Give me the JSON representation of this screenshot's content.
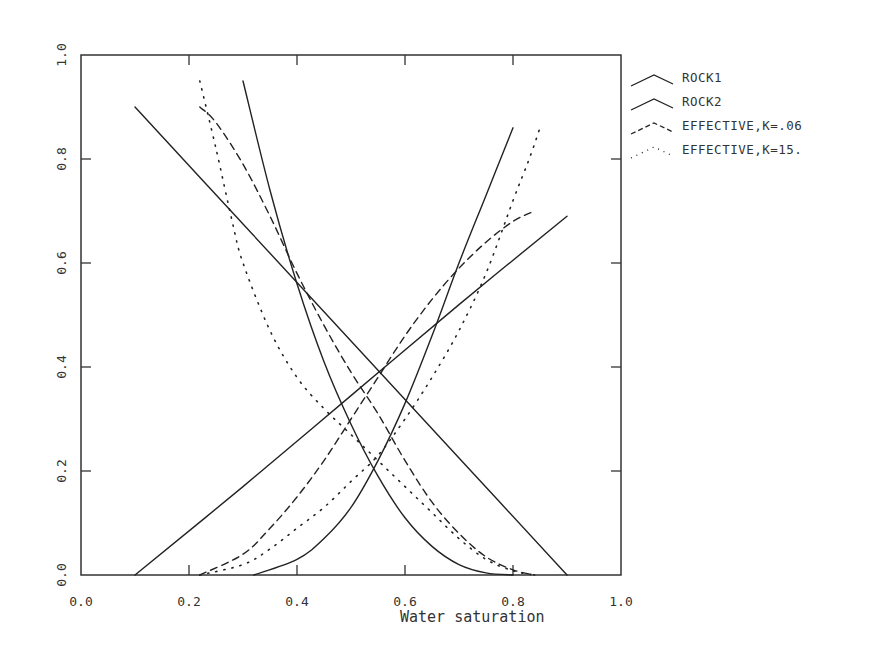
{
  "chart_data": {
    "type": "line",
    "title": "",
    "xlabel": "Water saturation",
    "ylabel": "",
    "xlim": [
      0.0,
      1.0
    ],
    "ylim": [
      0.0,
      1.0
    ],
    "grid": false,
    "legend_position": "right-outside-top",
    "x_ticks": [
      "0.0",
      "0.2",
      "0.4",
      "0.6",
      "0.8",
      "1.0"
    ],
    "y_ticks": [
      "0.0",
      "0.2",
      "0.4",
      "0.6",
      "0.8",
      "1.0"
    ],
    "series": [
      {
        "name": "ROCK1",
        "style": "solid",
        "curves": [
          {
            "label": "krw",
            "x": [
              0.1,
              0.3,
              0.5,
              0.7,
              0.9
            ],
            "y": [
              0.0,
              0.17,
              0.345,
              0.52,
              0.69
            ]
          },
          {
            "label": "kro",
            "x": [
              0.1,
              0.3,
              0.5,
              0.7,
              0.9
            ],
            "y": [
              0.9,
              0.675,
              0.45,
              0.225,
              0.0
            ]
          }
        ]
      },
      {
        "name": "ROCK2",
        "style": "solid",
        "curves": [
          {
            "label": "kro",
            "x": [
              0.3,
              0.35,
              0.4,
              0.45,
              0.5,
              0.55,
              0.6,
              0.65,
              0.7,
              0.75,
              0.8
            ],
            "y": [
              0.95,
              0.74,
              0.56,
              0.41,
              0.29,
              0.19,
              0.11,
              0.055,
              0.02,
              0.004,
              0.0
            ]
          },
          {
            "label": "krw",
            "x": [
              0.32,
              0.4,
              0.45,
              0.5,
              0.55,
              0.6,
              0.65,
              0.7,
              0.75,
              0.8
            ],
            "y": [
              0.0,
              0.03,
              0.07,
              0.13,
              0.22,
              0.33,
              0.46,
              0.6,
              0.73,
              0.86
            ]
          }
        ]
      },
      {
        "name": "EFFECTIVE,K=.06",
        "style": "dashed",
        "curves": [
          {
            "label": "kro",
            "x": [
              0.22,
              0.25,
              0.3,
              0.35,
              0.4,
              0.45,
              0.5,
              0.55,
              0.6,
              0.65,
              0.7,
              0.75,
              0.8,
              0.84
            ],
            "y": [
              0.9,
              0.87,
              0.79,
              0.69,
              0.58,
              0.48,
              0.39,
              0.31,
              0.22,
              0.14,
              0.08,
              0.035,
              0.01,
              0.0
            ]
          },
          {
            "label": "krw",
            "x": [
              0.22,
              0.3,
              0.35,
              0.4,
              0.45,
              0.5,
              0.55,
              0.6,
              0.65,
              0.7,
              0.75,
              0.8,
              0.84
            ],
            "y": [
              0.0,
              0.04,
              0.09,
              0.15,
              0.22,
              0.3,
              0.38,
              0.46,
              0.53,
              0.59,
              0.64,
              0.68,
              0.7
            ]
          }
        ]
      },
      {
        "name": "EFFECTIVE,K=15.",
        "style": "dotted",
        "curves": [
          {
            "label": "kro",
            "x": [
              0.22,
              0.25,
              0.28,
              0.3,
              0.35,
              0.4,
              0.45,
              0.5,
              0.55,
              0.6,
              0.65,
              0.7,
              0.75,
              0.8,
              0.84
            ],
            "y": [
              0.95,
              0.82,
              0.68,
              0.6,
              0.47,
              0.38,
              0.32,
              0.27,
              0.22,
              0.17,
              0.12,
              0.07,
              0.03,
              0.008,
              0.0
            ]
          },
          {
            "label": "krw",
            "x": [
              0.22,
              0.3,
              0.35,
              0.4,
              0.45,
              0.5,
              0.55,
              0.6,
              0.65,
              0.7,
              0.75,
              0.8,
              0.83,
              0.85
            ],
            "y": [
              0.0,
              0.02,
              0.05,
              0.09,
              0.13,
              0.18,
              0.23,
              0.3,
              0.38,
              0.47,
              0.58,
              0.72,
              0.8,
              0.86
            ]
          }
        ]
      }
    ]
  },
  "legend": {
    "items": [
      {
        "label": "ROCK1",
        "style": "solid"
      },
      {
        "label": "ROCK2",
        "style": "solid"
      },
      {
        "label": "EFFECTIVE,K=.06",
        "style": "dashed"
      },
      {
        "label": "EFFECTIVE,K=15.",
        "style": "dotted"
      }
    ]
  },
  "axes": {
    "x_title": "Water saturation",
    "x_ticks": [
      "0.0",
      "0.2",
      "0.4",
      "0.6",
      "0.8",
      "1.0"
    ],
    "y_ticks": [
      "0.0",
      "0.2",
      "0.4",
      "0.6",
      "0.8",
      "1.0"
    ]
  },
  "colors": {
    "line": "#222222",
    "frame": "#333333",
    "background": "#ffffff"
  }
}
